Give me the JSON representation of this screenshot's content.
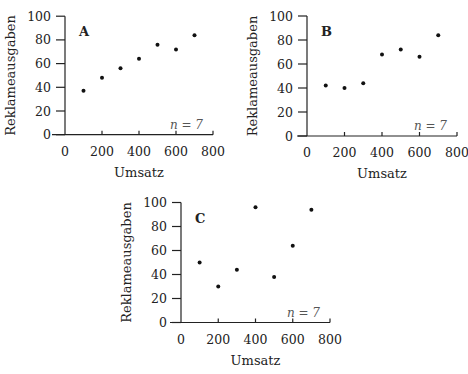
{
  "chart_data": [
    {
      "type": "scatter",
      "panel": "A",
      "title": "",
      "xlabel": "Umsatz",
      "ylabel": "Reklameausgaben",
      "xlim": [
        0,
        800
      ],
      "ylim": [
        0,
        100
      ],
      "xticks": [
        0,
        200,
        400,
        600,
        800
      ],
      "yticks": [
        0,
        20,
        40,
        60,
        80,
        100
      ],
      "annotation": "n = 7",
      "grid": false,
      "x": [
        100,
        200,
        300,
        400,
        500,
        600,
        700
      ],
      "y": [
        37,
        48,
        56,
        64,
        76,
        72,
        84
      ]
    },
    {
      "type": "scatter",
      "panel": "B",
      "title": "",
      "xlabel": "Umsatz",
      "ylabel": "Reklameausgaben",
      "xlim": [
        0,
        800
      ],
      "ylim": [
        0,
        100
      ],
      "xticks": [
        0,
        200,
        400,
        600,
        800
      ],
      "yticks": [
        0,
        20,
        40,
        60,
        80,
        100
      ],
      "annotation": "n = 7",
      "grid": false,
      "x": [
        100,
        200,
        300,
        400,
        500,
        600,
        700
      ],
      "y": [
        42,
        40,
        44,
        68,
        72,
        66,
        84
      ]
    },
    {
      "type": "scatter",
      "panel": "C",
      "title": "",
      "xlabel": "Umsatz",
      "ylabel": "Reklameausgaben",
      "xlim": [
        0,
        800
      ],
      "ylim": [
        0,
        100
      ],
      "xticks": [
        0,
        200,
        400,
        600,
        800
      ],
      "yticks": [
        0,
        20,
        40,
        60,
        80,
        100
      ],
      "annotation": "n = 7",
      "grid": false,
      "x": [
        100,
        200,
        300,
        400,
        500,
        600,
        700
      ],
      "y": [
        50,
        30,
        44,
        96,
        38,
        64,
        94
      ]
    }
  ],
  "layout": [
    {
      "x0": 65,
      "xw": 148,
      "y0": 134.7,
      "yh": 118.5,
      "axisLeftX": 52
    },
    {
      "x0": 307,
      "xw": 150,
      "y0": 136,
      "yh": 120,
      "axisLeftX": 297
    },
    {
      "x0": 181,
      "xw": 149,
      "y0": 322.5,
      "yh": 120,
      "axisLeftX": 170
    }
  ]
}
